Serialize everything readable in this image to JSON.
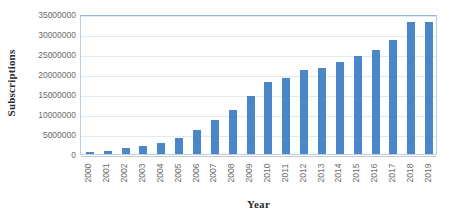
{
  "chart_data": {
    "type": "bar",
    "title": "",
    "xlabel": "Year",
    "ylabel": "Subscriptions",
    "categories": [
      "2000",
      "2001",
      "2002",
      "2003",
      "2004",
      "2005",
      "2006",
      "2007",
      "2008",
      "2009",
      "2010",
      "2011",
      "2012",
      "2013",
      "2014",
      "2015",
      "2016",
      "2017",
      "2018",
      "2019"
    ],
    "values": [
      500000,
      800000,
      1400000,
      2000000,
      2800000,
      4000000,
      6000000,
      8500000,
      11000000,
      14500000,
      18000000,
      19000000,
      21000000,
      21500000,
      23000000,
      24500000,
      26000000,
      28500000,
      33000000,
      33000000
    ],
    "series": [
      {
        "name": "Subscriptions",
        "values": [
          500000,
          800000,
          1400000,
          2000000,
          2800000,
          4000000,
          6000000,
          8500000,
          11000000,
          14500000,
          18000000,
          19000000,
          21000000,
          21500000,
          23000000,
          24500000,
          26000000,
          28500000,
          33000000,
          33000000
        ]
      }
    ],
    "ylim": [
      0,
      35000000
    ],
    "y_ticks": [
      0,
      5000000,
      10000000,
      15000000,
      20000000,
      25000000,
      30000000,
      35000000
    ],
    "y_tick_labels": [
      "0",
      "5000000",
      "10000000",
      "15000000",
      "20000000",
      "25000000",
      "30000000",
      "35000000"
    ],
    "grid": true,
    "legend": false,
    "legend_position": "none",
    "bar_color": "#4a86c8",
    "gridline_color": "#dfe9f2",
    "plot_border_color": "#b9d2e8",
    "tick_label_color": "#6b6b6b",
    "axis_title_color": "#2b2b2b",
    "x_tick_rotation": -90
  }
}
